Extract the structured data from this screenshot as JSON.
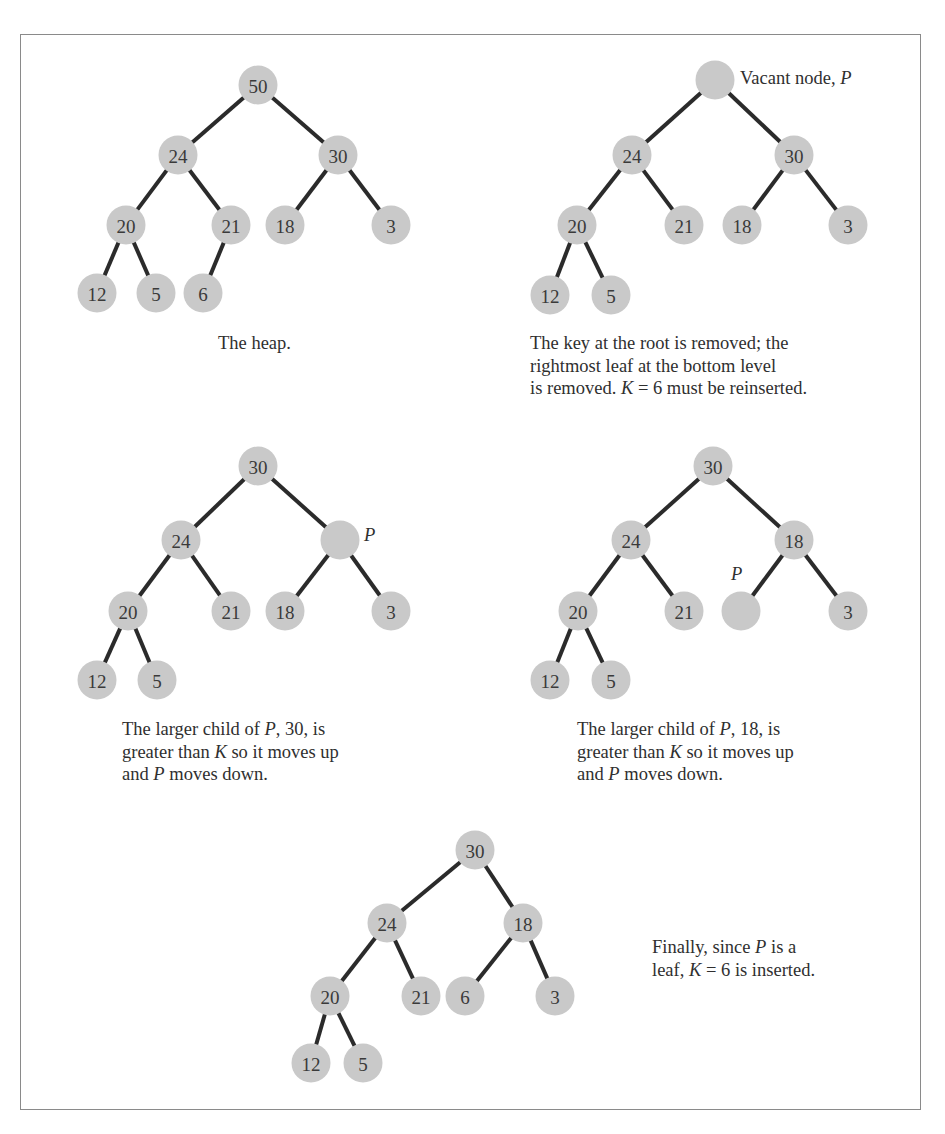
{
  "figure": {
    "node_color": "#c9c9c9",
    "edge_color": "#2b2b2b",
    "panels": [
      {
        "id": "panel-1",
        "caption_lines": [
          "The heap."
        ],
        "caption_pos": [
          218,
          332
        ],
        "nodes": [
          {
            "id": "n50",
            "label": "50",
            "x": 258,
            "y": 85
          },
          {
            "id": "n24",
            "label": "24",
            "x": 178,
            "y": 155
          },
          {
            "id": "n30",
            "label": "30",
            "x": 338,
            "y": 155
          },
          {
            "id": "n20",
            "label": "20",
            "x": 126,
            "y": 225
          },
          {
            "id": "n21",
            "label": "21",
            "x": 231,
            "y": 225
          },
          {
            "id": "n18",
            "label": "18",
            "x": 285,
            "y": 225
          },
          {
            "id": "n3",
            "label": "3",
            "x": 391,
            "y": 225
          },
          {
            "id": "n12",
            "label": "12",
            "x": 97,
            "y": 293
          },
          {
            "id": "n5",
            "label": "5",
            "x": 156,
            "y": 293
          },
          {
            "id": "n6",
            "label": "6",
            "x": 203,
            "y": 293
          }
        ],
        "edges": [
          [
            "n50",
            "n24"
          ],
          [
            "n50",
            "n30"
          ],
          [
            "n24",
            "n20"
          ],
          [
            "n24",
            "n21"
          ],
          [
            "n30",
            "n18"
          ],
          [
            "n30",
            "n3"
          ],
          [
            "n20",
            "n12"
          ],
          [
            "n20",
            "n5"
          ],
          [
            "n21",
            "n6"
          ]
        ]
      },
      {
        "id": "panel-2",
        "caption_lines": [
          "The key at the root is removed; the",
          "rightmost leaf at the bottom level",
          "is removed. K = 6 must be reinserted."
        ],
        "caption_pos": [
          530,
          332
        ],
        "side_label": {
          "text": "Vacant node, ",
          "italic": "P",
          "x": 740,
          "y": 68
        },
        "nodes": [
          {
            "id": "v",
            "label": "",
            "x": 715,
            "y": 80
          },
          {
            "id": "n24",
            "label": "24",
            "x": 632,
            "y": 155
          },
          {
            "id": "n30",
            "label": "30",
            "x": 794,
            "y": 155
          },
          {
            "id": "n20",
            "label": "20",
            "x": 577,
            "y": 225
          },
          {
            "id": "n21",
            "label": "21",
            "x": 684,
            "y": 225
          },
          {
            "id": "n18",
            "label": "18",
            "x": 742,
            "y": 225
          },
          {
            "id": "n3",
            "label": "3",
            "x": 848,
            "y": 225
          },
          {
            "id": "n12",
            "label": "12",
            "x": 550,
            "y": 295
          },
          {
            "id": "n5",
            "label": "5",
            "x": 611,
            "y": 295
          }
        ],
        "edges": [
          [
            "v",
            "n24"
          ],
          [
            "v",
            "n30"
          ],
          [
            "n24",
            "n20"
          ],
          [
            "n24",
            "n21"
          ],
          [
            "n30",
            "n18"
          ],
          [
            "n30",
            "n3"
          ],
          [
            "n20",
            "n12"
          ],
          [
            "n20",
            "n5"
          ]
        ]
      },
      {
        "id": "panel-3",
        "caption_lines": [
          "The larger child of P, 30, is",
          "greater than K so it moves up",
          "and P moves down."
        ],
        "caption_pos": [
          122,
          718
        ],
        "side_label": {
          "text": "",
          "italic": "P",
          "x": 364,
          "y": 525
        },
        "nodes": [
          {
            "id": "n30",
            "label": "30",
            "x": 258,
            "y": 466
          },
          {
            "id": "n24",
            "label": "24",
            "x": 181,
            "y": 540
          },
          {
            "id": "p",
            "label": "",
            "x": 340,
            "y": 540
          },
          {
            "id": "n20",
            "label": "20",
            "x": 128,
            "y": 611
          },
          {
            "id": "n21",
            "label": "21",
            "x": 231,
            "y": 611
          },
          {
            "id": "n18",
            "label": "18",
            "x": 285,
            "y": 611
          },
          {
            "id": "n3",
            "label": "3",
            "x": 391,
            "y": 611
          },
          {
            "id": "n12",
            "label": "12",
            "x": 97,
            "y": 680
          },
          {
            "id": "n5",
            "label": "5",
            "x": 157,
            "y": 680
          }
        ],
        "edges": [
          [
            "n30",
            "n24"
          ],
          [
            "n30",
            "p"
          ],
          [
            "n24",
            "n20"
          ],
          [
            "n24",
            "n21"
          ],
          [
            "p",
            "n18"
          ],
          [
            "p",
            "n3"
          ],
          [
            "n20",
            "n12"
          ],
          [
            "n20",
            "n5"
          ]
        ]
      },
      {
        "id": "panel-4",
        "caption_lines": [
          "The larger child of P, 18, is",
          "greater than K so it moves up",
          "and P moves down."
        ],
        "caption_pos": [
          577,
          718
        ],
        "side_label": {
          "text": "",
          "italic": "P",
          "x": 731,
          "y": 564
        },
        "nodes": [
          {
            "id": "n30",
            "label": "30",
            "x": 713,
            "y": 466
          },
          {
            "id": "n24",
            "label": "24",
            "x": 631,
            "y": 540
          },
          {
            "id": "n18",
            "label": "18",
            "x": 794,
            "y": 540
          },
          {
            "id": "n20",
            "label": "20",
            "x": 578,
            "y": 611
          },
          {
            "id": "n21",
            "label": "21",
            "x": 684,
            "y": 611
          },
          {
            "id": "p",
            "label": "",
            "x": 741,
            "y": 611
          },
          {
            "id": "n3",
            "label": "3",
            "x": 848,
            "y": 611
          },
          {
            "id": "n12",
            "label": "12",
            "x": 550,
            "y": 680
          },
          {
            "id": "n5",
            "label": "5",
            "x": 611,
            "y": 680
          }
        ],
        "edges": [
          [
            "n30",
            "n24"
          ],
          [
            "n30",
            "n18"
          ],
          [
            "n24",
            "n20"
          ],
          [
            "n24",
            "n21"
          ],
          [
            "n18",
            "p"
          ],
          [
            "n18",
            "n3"
          ],
          [
            "n20",
            "n12"
          ],
          [
            "n20",
            "n5"
          ]
        ]
      },
      {
        "id": "panel-5",
        "caption_lines": [
          "Finally, since P is a",
          "leaf, K = 6 is inserted."
        ],
        "caption_pos": [
          652,
          936
        ],
        "nodes": [
          {
            "id": "n30",
            "label": "30",
            "x": 475,
            "y": 850
          },
          {
            "id": "n24",
            "label": "24",
            "x": 387,
            "y": 923
          },
          {
            "id": "n18",
            "label": "18",
            "x": 523,
            "y": 923
          },
          {
            "id": "n20",
            "label": "20",
            "x": 330,
            "y": 996
          },
          {
            "id": "n21",
            "label": "21",
            "x": 421,
            "y": 996
          },
          {
            "id": "n6",
            "label": "6",
            "x": 465,
            "y": 996
          },
          {
            "id": "n3",
            "label": "3",
            "x": 555,
            "y": 996
          },
          {
            "id": "n12",
            "label": "12",
            "x": 311,
            "y": 1063
          },
          {
            "id": "n5",
            "label": "5",
            "x": 363,
            "y": 1063
          }
        ],
        "edges": [
          [
            "n30",
            "n24"
          ],
          [
            "n30",
            "n18"
          ],
          [
            "n24",
            "n20"
          ],
          [
            "n24",
            "n21"
          ],
          [
            "n18",
            "n6"
          ],
          [
            "n18",
            "n3"
          ],
          [
            "n20",
            "n12"
          ],
          [
            "n20",
            "n5"
          ]
        ]
      }
    ]
  }
}
